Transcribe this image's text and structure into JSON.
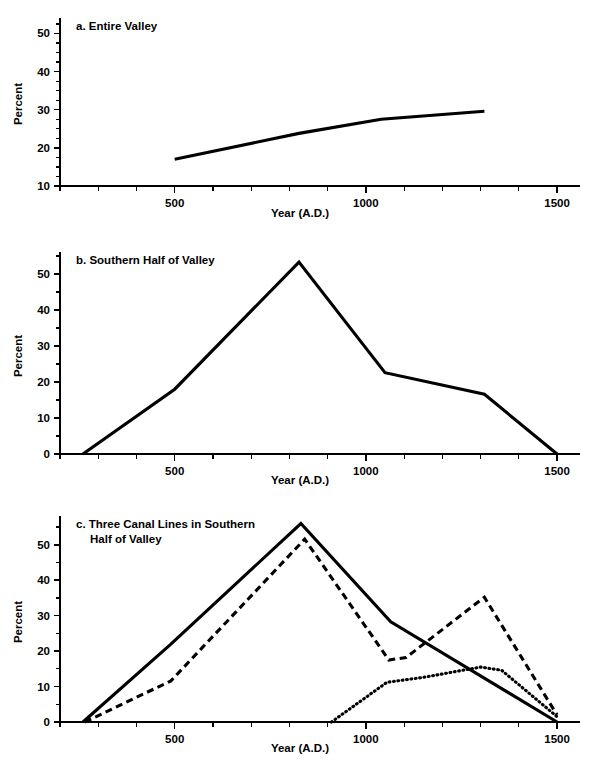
{
  "figure": {
    "background": "#ffffff",
    "ink": "#000000",
    "panels": [
      "a",
      "b",
      "c"
    ]
  },
  "panel_a": {
    "title": "a. Entire Valley",
    "xlabel": "Year (A.D.)",
    "ylabel": "Percent"
  },
  "panel_b": {
    "title": "b. Southern Half of Valley",
    "xlabel": "Year (A.D.)",
    "ylabel": "Percent"
  },
  "panel_c": {
    "title_line1": "c. Three Canal Lines in Southern",
    "title_line2": "Half of Valley",
    "xlabel": "Year (A.D.)",
    "ylabel": "Percent"
  },
  "chart_data": [
    {
      "id": "a",
      "type": "line",
      "title": "a. Entire Valley",
      "xlabel": "Year (A.D.)",
      "ylabel": "Percent",
      "xlim": [
        200,
        1560
      ],
      "ylim": [
        10,
        53
      ],
      "xticks": [
        500,
        1000,
        1500
      ],
      "xtick_labels": [
        "500",
        "1000",
        "1500"
      ],
      "xminor_step": 100,
      "yticks": [
        10,
        20,
        30,
        40,
        50
      ],
      "ytick_labels": [
        "10",
        "20",
        "30",
        "40",
        "50"
      ],
      "yminor_step": 2.5,
      "grid": false,
      "legend": "none",
      "series": [
        {
          "name": "Entire Valley",
          "style": "solid",
          "points": [
            {
              "x": 500,
              "y": 17.0
            },
            {
              "x": 825,
              "y": 23.8
            },
            {
              "x": 1040,
              "y": 27.5
            },
            {
              "x": 1310,
              "y": 29.6
            }
          ]
        }
      ]
    },
    {
      "id": "b",
      "type": "line",
      "title": "b. Southern Half of Valley",
      "xlabel": "Year (A.D.)",
      "ylabel": "Percent",
      "xlim": [
        200,
        1560
      ],
      "ylim": [
        0,
        55
      ],
      "xticks": [
        500,
        1000,
        1500
      ],
      "xtick_labels": [
        "500",
        "1000",
        "1500"
      ],
      "xminor_step": 100,
      "yticks": [
        0,
        10,
        20,
        30,
        40,
        50
      ],
      "ytick_labels": [
        "0",
        "10",
        "20",
        "30",
        "40",
        "50"
      ],
      "yminor_step": 5,
      "grid": false,
      "legend": "none",
      "series": [
        {
          "name": "Southern Half of Valley",
          "style": "solid",
          "points": [
            {
              "x": 260,
              "y": 0.0
            },
            {
              "x": 500,
              "y": 18.0
            },
            {
              "x": 825,
              "y": 53.3
            },
            {
              "x": 1050,
              "y": 22.6
            },
            {
              "x": 1310,
              "y": 16.6
            },
            {
              "x": 1500,
              "y": 0.0
            }
          ]
        }
      ]
    },
    {
      "id": "c",
      "type": "line",
      "title": "c. Three Canal Lines in Southern Half of Valley",
      "xlabel": "Year (A.D.)",
      "ylabel": "Percent",
      "xlim": [
        200,
        1560
      ],
      "ylim": [
        0,
        57
      ],
      "xticks": [
        500,
        1000,
        1500
      ],
      "xtick_labels": [
        "500",
        "1000",
        "1500"
      ],
      "xminor_step": 100,
      "yticks": [
        0,
        10,
        20,
        30,
        40,
        50
      ],
      "ytick_labels": [
        "0",
        "10",
        "20",
        "30",
        "40",
        "50"
      ],
      "yminor_step": 5,
      "grid": false,
      "legend": "none",
      "series": [
        {
          "name": "Canal line 1",
          "style": "solid",
          "points": [
            {
              "x": 260,
              "y": 0.0
            },
            {
              "x": 490,
              "y": 22.0
            },
            {
              "x": 830,
              "y": 56.0
            },
            {
              "x": 1065,
              "y": 28.3
            },
            {
              "x": 1500,
              "y": 0.0
            }
          ]
        },
        {
          "name": "Canal line 2",
          "style": "dashed",
          "points": [
            {
              "x": 265,
              "y": 0.0
            },
            {
              "x": 490,
              "y": 11.6
            },
            {
              "x": 840,
              "y": 51.6
            },
            {
              "x": 1060,
              "y": 17.5
            },
            {
              "x": 1105,
              "y": 18.2
            },
            {
              "x": 1310,
              "y": 35.2
            },
            {
              "x": 1500,
              "y": 2.0
            }
          ]
        },
        {
          "name": "Canal line 3",
          "style": "dotted",
          "points": [
            {
              "x": 910,
              "y": 0.0
            },
            {
              "x": 1055,
              "y": 11.2
            },
            {
              "x": 1150,
              "y": 12.6
            },
            {
              "x": 1300,
              "y": 15.5
            },
            {
              "x": 1355,
              "y": 14.6
            },
            {
              "x": 1500,
              "y": 1.5
            }
          ]
        }
      ]
    }
  ]
}
